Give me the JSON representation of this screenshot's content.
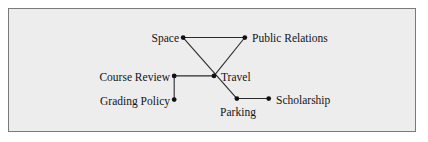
{
  "figure": {
    "kind": "node-link-diagram",
    "border_color": "#7a7a7a",
    "background_color": "#ededed",
    "page_background": "#ffffff",
    "edge_color": "#2b2b2b",
    "node_color": "#111111"
  },
  "graph": {
    "nodes": [
      {
        "id": "space",
        "label": "Space",
        "x": 175,
        "y": 29,
        "label_side": "left"
      },
      {
        "id": "public_relations",
        "label": "Public Relations",
        "x": 237,
        "y": 29,
        "label_side": "right"
      },
      {
        "id": "course_review",
        "label": "Course Review",
        "x": 166,
        "y": 68,
        "label_side": "left"
      },
      {
        "id": "travel",
        "label": "Travel",
        "x": 206,
        "y": 68,
        "label_side": "right"
      },
      {
        "id": "grading_policy",
        "label": "Grading Policy",
        "x": 166,
        "y": 92,
        "label_side": "left"
      },
      {
        "id": "parking",
        "label": "Parking",
        "x": 229,
        "y": 91,
        "label_side": "below"
      },
      {
        "id": "scholarship",
        "label": "Scholarship",
        "x": 261,
        "y": 91,
        "label_side": "right"
      }
    ],
    "edges": [
      {
        "from": "space",
        "to": "public_relations"
      },
      {
        "from": "space",
        "to": "parking"
      },
      {
        "from": "public_relations",
        "to": "travel"
      },
      {
        "from": "course_review",
        "to": "travel"
      },
      {
        "from": "course_review",
        "to": "grading_policy"
      },
      {
        "from": "parking",
        "to": "scholarship"
      }
    ]
  }
}
